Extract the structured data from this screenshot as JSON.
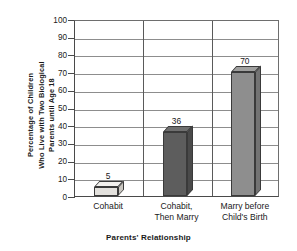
{
  "chart_data": {
    "type": "bar",
    "title": "",
    "xlabel": "Parents' Relationship",
    "ylabel": "Percentage of Children Who Live with Two Biological Parents until Age 18",
    "ylabel_lines": [
      "Percentage of Children",
      "Who Live with Two Biological",
      "Parents until Age 18"
    ],
    "categories": [
      "Cohabit",
      "Cohabit, Then Marry",
      "Marry before Child's Birth"
    ],
    "category_lines": [
      [
        "Cohabit"
      ],
      [
        "Cohabit,",
        "Then Marry"
      ],
      [
        "Marry before",
        "Child's Birth"
      ]
    ],
    "values": [
      5,
      36,
      70
    ],
    "value_labels": [
      "5",
      "36",
      "70"
    ],
    "ylim": [
      0,
      100
    ],
    "ytick_step": 10,
    "yticks": [
      100,
      90,
      80,
      70,
      60,
      50,
      40,
      30,
      20,
      10,
      0
    ],
    "ytick_labels": [
      "100",
      "90",
      "80",
      "70",
      "60",
      "50",
      "40",
      "30",
      "20",
      "10",
      "0"
    ],
    "grid": true,
    "legend": null,
    "bar_colors": [
      "#e3e1dd",
      "#5d5d5d",
      "#8e8e8e"
    ],
    "bar_top_colors": [
      "#f2f1ee",
      "#6f6f6f",
      "#a0a09f"
    ],
    "bar_side_colors": [
      "#c9c6c0",
      "#4a4a4a",
      "#737373"
    ]
  }
}
